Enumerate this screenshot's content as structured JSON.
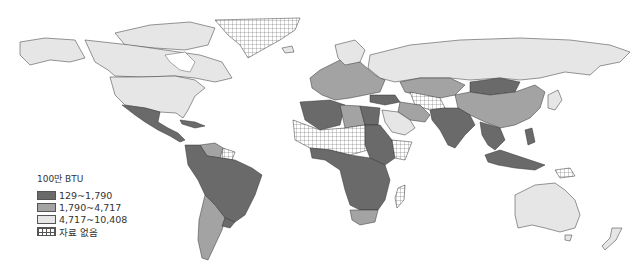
{
  "legend": {
    "unit": "100만 BTU",
    "items": [
      {
        "label": "129~1,790",
        "color": "#6a6a6a",
        "class": "c1"
      },
      {
        "label": "1,790~4,717",
        "color": "#a3a3a3",
        "class": "c2"
      },
      {
        "label": "4,717~10,408",
        "color": "#e6e6e6",
        "class": "c3"
      },
      {
        "label": "자료 없음",
        "pattern": "grid",
        "class": "nd"
      }
    ]
  },
  "map": {
    "type": "choropleth world map",
    "regions": {
      "north_america_canada_usa": "4,717~10,408",
      "greenland": "자료 없음",
      "mexico_central_america": "129~1,790",
      "south_america_north": "129~1,790",
      "venezuela": "1,790~4,717",
      "argentina_chile": "1,790~4,717",
      "russia": "4,717~10,408",
      "europe": "1,790~4,717",
      "kazakhstan": "1,790~4,717",
      "mongolia": "129~1,790",
      "china": "1,790~4,717",
      "india_south_asia": "129~1,790",
      "saudi_arabia": "4,717~10,408",
      "iran": "1,790~4,717",
      "libya": "1,790~4,717",
      "north_africa_sahel": "자료 없음",
      "sub_saharan_africa": "129~1,790",
      "south_africa": "1,790~4,717",
      "madagascar": "자료 없음",
      "southeast_asia": "129~1,790",
      "australia": "4,717~10,408",
      "new_zealand": "4,717~10,408",
      "japan": "4,717~10,408"
    }
  }
}
